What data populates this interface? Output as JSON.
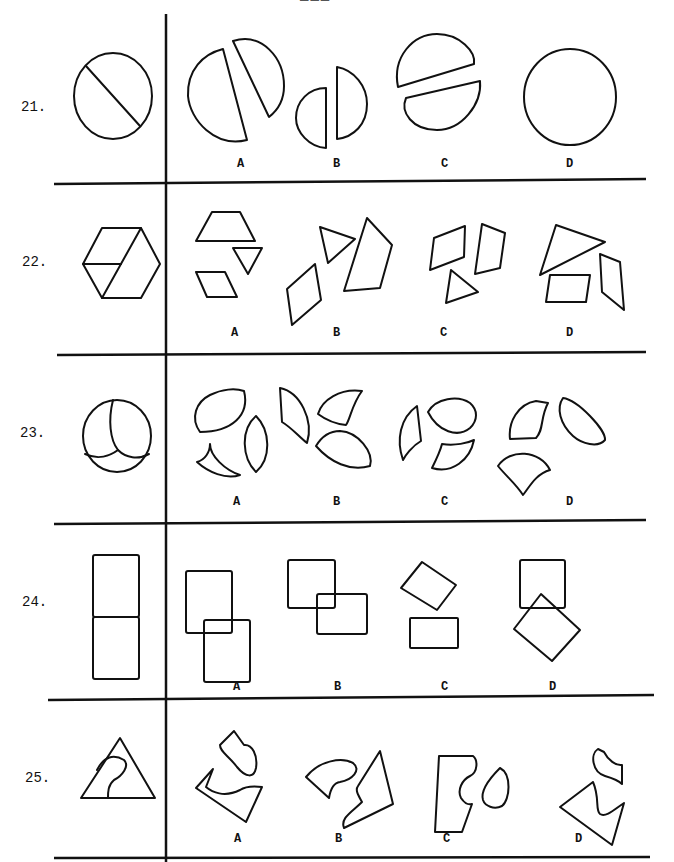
{
  "document": {
    "type": "spatial-reasoning test page (shape assembly)",
    "header_fragment": "———",
    "instruction_implied": "Choose the set of pieces (A–D) that can be assembled into the figure on the left."
  },
  "questions": [
    {
      "number": "21.",
      "target": "circle divided by a diagonal chord",
      "options": [
        {
          "label": "A",
          "desc": "two unequal circle segments"
        },
        {
          "label": "B",
          "desc": "two half-circles of different sizes"
        },
        {
          "label": "C",
          "desc": "two segments cut by oblique chord"
        },
        {
          "label": "D",
          "desc": "single whole circle"
        }
      ]
    },
    {
      "number": "22.",
      "target": "hexagon divided into three pieces",
      "options": [
        {
          "label": "A",
          "desc": "trapezoid, triangle, parallelogram"
        },
        {
          "label": "B",
          "desc": "triangle, large quadrilateral, parallelogram"
        },
        {
          "label": "C",
          "desc": "two parallelograms and a triangle"
        },
        {
          "label": "D",
          "desc": "triangle and two parallelograms"
        }
      ]
    },
    {
      "number": "23.",
      "target": "circle divided by three curved arcs into three pieces",
      "options": [
        {
          "label": "A",
          "desc": "lens, curved wedge, almond"
        },
        {
          "label": "B",
          "desc": "curved wedges and lens"
        },
        {
          "label": "C",
          "desc": "sliver, lens, curved wedge"
        },
        {
          "label": "D",
          "desc": "curved wedge, oval, fan-shape"
        }
      ]
    },
    {
      "number": "24.",
      "target": "two stacked squares forming a rectangle",
      "options": [
        {
          "label": "A",
          "desc": "two offset squares"
        },
        {
          "label": "B",
          "desc": "two overlapping rectangles"
        },
        {
          "label": "C",
          "desc": "tilted rectangle and flat rectangle"
        },
        {
          "label": "D",
          "desc": "square and rotated diamond"
        }
      ]
    },
    {
      "number": "25.",
      "target": "triangle with an inner curved hook shape",
      "options": [
        {
          "label": "A",
          "desc": "blob and notched triangle"
        },
        {
          "label": "B",
          "desc": "hook shape and notched triangle"
        },
        {
          "label": "C",
          "desc": "notched rectangle and blob"
        },
        {
          "label": "D",
          "desc": "hook and notched triangle"
        }
      ]
    }
  ]
}
